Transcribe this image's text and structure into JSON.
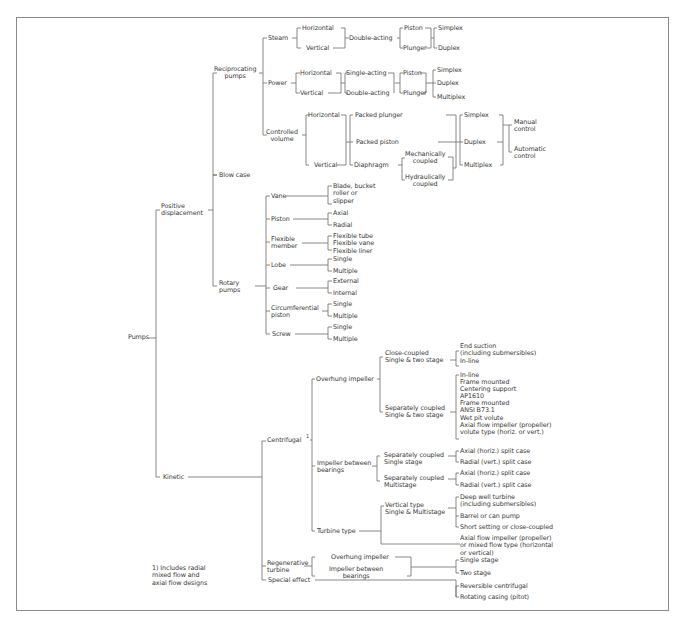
{
  "diagram": {
    "root": "Pumps",
    "footnote": "1) Includes radial\nmixed flow and\naxial flow designs",
    "labels": {
      "pumps": "Pumps",
      "positive_displacement": "Positive\ndisplacement",
      "kinetic": "Kinetic",
      "reciprocating": "Reciprocating\npumps",
      "blow_case": "Blow case",
      "rotary": "Rotary\npumps",
      "steam": "Steam",
      "power": "Power",
      "controlled_volume": "Controlled\nvolume",
      "steam_horizontal": "Horizontal",
      "steam_vertical": "Vertical",
      "steam_double_acting": "Double-acting",
      "steam_piston": "Piston",
      "steam_plunger": "Plunger",
      "steam_simplex": "Simplex",
      "steam_duplex": "Duplex",
      "power_horizontal": "Horizontal",
      "power_vertical": "Vertical",
      "power_single_acting": "Single-acting",
      "power_double_acting": "Double-acting",
      "power_piston": "Piston",
      "power_plunger": "Plunger",
      "power_simplex": "Simplex",
      "power_duplex": "Duplex",
      "power_multiplex": "Multiplex",
      "cv_horizontal": "Horizontal",
      "cv_vertical": "Vertical",
      "cv_packed_plunger": "Packed plunger",
      "cv_packed_piston": "Packed piston",
      "cv_diaphragm": "Diaphragm",
      "cv_mech": "Mechanically\ncoupled",
      "cv_hydr": "Hydraulically\ncoupled",
      "cv_simplex": "Simplex",
      "cv_duplex": "Duplex",
      "cv_multiplex": "Multiplex",
      "cv_manual": "Manual\ncontrol",
      "cv_automatic": "Automatic\ncontrol",
      "vane": "Vane",
      "vane_types": "Blade, bucket\nroller or\nslipper",
      "rot_piston": "Piston",
      "rot_piston_axial": "Axial",
      "rot_piston_radial": "Radial",
      "flexible_member": "Flexible\nmember",
      "flexible_types": "Flexible tube\nFlexible vane\nFlexible liner",
      "lobe": "Lobe",
      "lobe_single": "Single",
      "lobe_multiple": "Multiple",
      "gear": "Gear",
      "gear_external": "External",
      "gear_internal": "Internal",
      "circumferential": "Circumferential\npiston",
      "circ_single": "Single",
      "circ_multiple": "Multiple",
      "screw": "Screw",
      "screw_single": "Single",
      "screw_multiple": "Multiple",
      "centrifugal": "Centrifugal",
      "centrifugal_note": "1",
      "overhung": "Overhung impeller",
      "close_coupled": "Close-coupled\nSingle & two stage",
      "close_coupled_types": "End suction\n(including submersibles)\nIn-line",
      "sep_coupled": "Separately coupled\nSingle & two stage",
      "sep_coupled_types": "In-line\nFrame mounted\nCentering support\nAP1610\nFrame mounted\nANSI B73.1\nWet pit volute\nAxial flow impeller (propeller)\nvolute type (horiz. or vert.)",
      "between_bearings": "Impeller between\nbearings",
      "bb_single": "Separately coupled\nSingle stage",
      "bb_multi": "Separately coupled\nMultistage",
      "bb_single_axial": "Axial (horiz.) split case",
      "bb_single_radial": "Radial (vert.) split case",
      "bb_multi_axial": "Axial (horiz.) split case",
      "bb_multi_radial": "Radial (vert.) split case",
      "turbine_type": "Turbine type",
      "vertical_type": "Vertical type\nSingle & Multistage",
      "deep_well": "Deep well turbine\n(including submersibles)",
      "barrel": "Barrel or can pump",
      "short_setting": "Short setting or close-coupled",
      "axial_mixed": "Axial flow impeller (propeller)\nor mixed flow type (horizontal\nor vertical)",
      "regenerative": "Regenerative\nturbine",
      "regen_overhung": "Overhung impeller",
      "regen_between": "Impeller between\nbearings",
      "regen_single": "Single stage",
      "regen_two": "Two stage",
      "special_effect": "Special effect",
      "reversible": "Reversible centrifugal",
      "rotating_casing": "Rotating casing (pitot)"
    }
  }
}
